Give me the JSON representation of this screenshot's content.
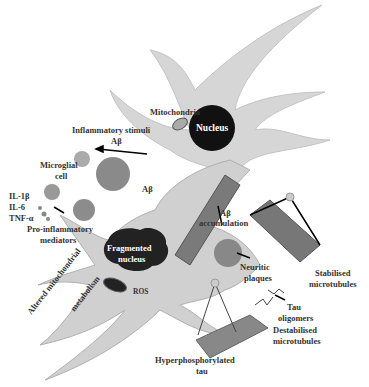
{
  "diagram": {
    "labels": {
      "mitochondria": "Mitochondria",
      "nucleus": "Nucleus",
      "inflammatory_stimuli": "Inflammatory stimuli",
      "abeta_1": "Aβ",
      "microglial_cell_1": "Microglial",
      "microglial_cell_2": "cell",
      "abeta_2": "Aβ",
      "il1b": "IL-1β",
      "il6": "IL-6",
      "tnfa": "TNF-α",
      "pro_inflammatory_1": "Pro-inflammatory",
      "pro_inflammatory_2": "mediators",
      "abeta_accum_1": "Aβ",
      "abeta_accum_2": "accumulation",
      "fragmented_1": "Fragmented",
      "fragmented_2": "nucleus",
      "ros": "ROS",
      "neuritic_1": "Neuritic",
      "neuritic_2": "plaques",
      "stabilised_1": "Stabilised",
      "stabilised_2": "microtubules",
      "tau_olig_1": "Tau",
      "tau_olig_2": "oligomers",
      "destab_1": "Destabilised",
      "destab_2": "microtubules",
      "altered_1": "Altered mitochondrial",
      "altered_2": "metabolism",
      "hyper_1": "Hyperphosphorylated",
      "hyper_2": "tau"
    },
    "colors": {
      "cell": "#d4d4d4",
      "cell_edge": "#b8b8b8",
      "nucleus": "#111111",
      "plaque": "#8a8a8a",
      "text": "#333333"
    }
  }
}
